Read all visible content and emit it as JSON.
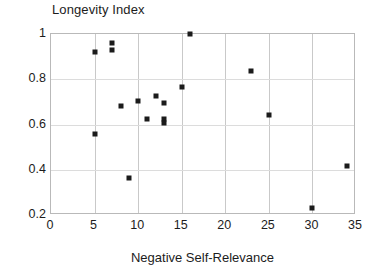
{
  "chart_data": {
    "type": "scatter",
    "title": "Longevity Index",
    "xlabel": "Negative Self-Relevance",
    "ylabel": "Longevity Index",
    "xlim": [
      0,
      35
    ],
    "ylim": [
      0.2,
      1.0
    ],
    "xticks": [
      0,
      5,
      10,
      15,
      20,
      25,
      30,
      35
    ],
    "xtick_labels": [
      "0",
      "5",
      "10",
      "15",
      "20",
      "25",
      "30",
      "35"
    ],
    "yticks": [
      0.2,
      0.4,
      0.6,
      0.8,
      1.0
    ],
    "ytick_labels": [
      "0.2",
      "0.4",
      "0.6",
      "0.8",
      "1"
    ],
    "grid": true,
    "legend": null,
    "marker": "square",
    "marker_color": "#1b1b1b",
    "points": [
      {
        "x": 5,
        "y": 0.92
      },
      {
        "x": 5,
        "y": 0.56
      },
      {
        "x": 7,
        "y": 0.96
      },
      {
        "x": 7,
        "y": 0.93
      },
      {
        "x": 8,
        "y": 0.68
      },
      {
        "x": 9,
        "y": 0.365
      },
      {
        "x": 10,
        "y": 0.705
      },
      {
        "x": 11,
        "y": 0.625
      },
      {
        "x": 12,
        "y": 0.725
      },
      {
        "x": 13,
        "y": 0.695
      },
      {
        "x": 13,
        "y": 0.625
      },
      {
        "x": 13,
        "y": 0.605
      },
      {
        "x": 15,
        "y": 0.765
      },
      {
        "x": 16,
        "y": 1.0
      },
      {
        "x": 23,
        "y": 0.835
      },
      {
        "x": 25,
        "y": 0.64
      },
      {
        "x": 30,
        "y": 0.23
      },
      {
        "x": 34,
        "y": 0.415
      }
    ]
  },
  "colors": {
    "background": "#ffffff",
    "marker": "#1b1b1b",
    "frame": "#b9b9b9",
    "gridline_v": "#c9c9c9",
    "gridline_h": "#dcdcdc",
    "text": "#1c1c1c"
  }
}
